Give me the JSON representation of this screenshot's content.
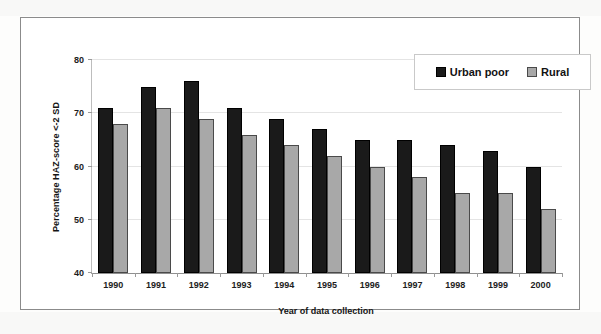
{
  "chart_data": {
    "type": "bar",
    "title": "",
    "xlabel": "Year of data collection",
    "ylabel": "Percentage HAZ-score <-2 SD",
    "categories": [
      "1990",
      "1991",
      "1992",
      "1993",
      "1994",
      "1995",
      "1996",
      "1997",
      "1998",
      "1999",
      "2000"
    ],
    "series": [
      {
        "name": "Urban poor",
        "color": "#1a1a1a",
        "values": [
          71,
          75,
          76,
          71,
          69,
          67,
          65,
          65,
          64,
          63,
          60
        ]
      },
      {
        "name": "Rural",
        "color": "#a8a8a8",
        "values": [
          68,
          71,
          69,
          66,
          64,
          62,
          60,
          58,
          55,
          55,
          52
        ]
      }
    ],
    "ylim": [
      40,
      80
    ],
    "yticks": [
      40,
      50,
      60,
      70,
      80
    ],
    "ytick_labels": [
      "40",
      "50",
      "60",
      "70",
      "80"
    ],
    "grid": false,
    "legend_position": "top-right",
    "bar_style": "grouped"
  },
  "legend": {
    "entries": [
      {
        "label": "Urban poor",
        "swatch": "dark-square-swatch"
      },
      {
        "label": "Rural",
        "swatch": "gray-square-swatch"
      }
    ]
  },
  "axes": {
    "y_title": "Percentage HAZ-score <-2 SD",
    "x_title": "Year of data collection"
  }
}
